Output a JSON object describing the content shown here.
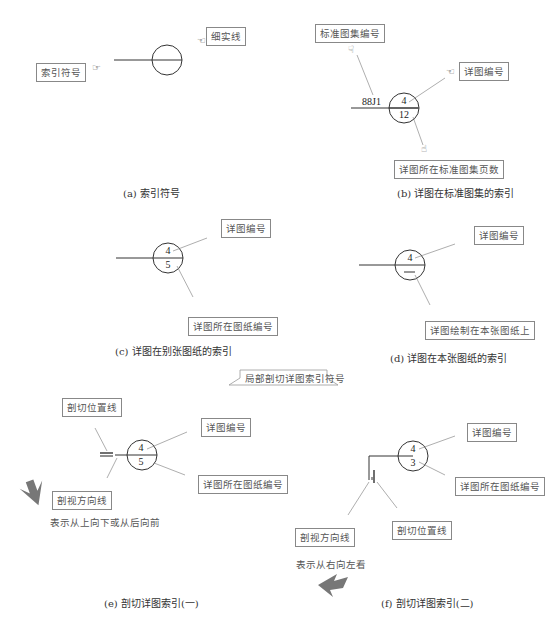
{
  "panel_a": {
    "labels": {
      "thin_line": "细实线",
      "index_symbol": "索引符号"
    },
    "caption": "(a) 索引符号"
  },
  "panel_b": {
    "labels": {
      "atlas_number": "标准图集编号",
      "detail_number": "详图编号",
      "atlas_page": "详图所在标准图集页数"
    },
    "atlas_code": "88J1",
    "top": "4",
    "bottom": "12",
    "caption": "(b) 详图在标准图集的索引"
  },
  "panel_c": {
    "labels": {
      "detail_number": "详图编号",
      "sheet_number": "详图所在图纸编号"
    },
    "top": "4",
    "bottom": "5",
    "caption": "(c) 详图在别张图纸的索引"
  },
  "panel_d": {
    "labels": {
      "detail_number": "详图编号",
      "same_sheet": "详图绘制在本张图纸上"
    },
    "top": "4",
    "bottom": "—",
    "caption": "(d) 详图在本张图纸的索引"
  },
  "banner": {
    "text": "局部剖切详图索引符号"
  },
  "panel_e": {
    "labels": {
      "cut_position": "剖切位置线",
      "detail_number": "详图编号",
      "view_direction": "剖视方向线",
      "sheet_number": "详图所在图纸编号"
    },
    "note": "表示从上向下或从后向前",
    "top": "4",
    "bottom": "5",
    "caption": "(e) 剖切详图索引(一)"
  },
  "panel_f": {
    "labels": {
      "detail_number": "详图编号",
      "sheet_number": "详图所在图纸编号",
      "view_direction": "剖视方向线",
      "cut_position": "剖切位置线"
    },
    "note": "表示从右向左看",
    "top": "4",
    "bottom": "3",
    "caption": "(f) 剖切详图索引(二)"
  },
  "colors": {
    "line": "#333333",
    "leader": "#777777",
    "arrow": "#777777",
    "label_border": "#888888"
  }
}
